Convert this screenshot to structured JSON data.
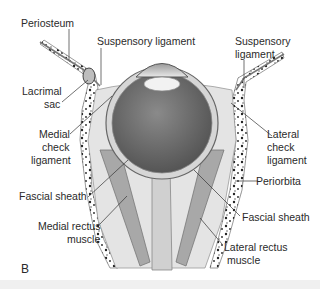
{
  "figure": {
    "panel_letter": "B",
    "labels": {
      "periosteum": "Periosteum",
      "suspensory_ligament_left": "Suspensory ligament",
      "suspensory_ligament_right_line1": "Suspensory",
      "suspensory_ligament_right_line2": "ligament",
      "lacrimal_sac_line1": "Lacrimal",
      "lacrimal_sac_line2": "sac",
      "medial_check_line1": "Medial",
      "medial_check_line2": "check",
      "medial_check_line3": "ligament",
      "lateral_check_line1": "Lateral",
      "lateral_check_line2": "check",
      "lateral_check_line3": "ligament",
      "fascial_sheath_left": "Fascial sheath",
      "periorbita": "Periorbita",
      "fascial_sheath_right": "Fascial sheath",
      "medial_rectus_line1": "Medial rectus",
      "medial_rectus_line2": "muscle",
      "lateral_rectus_line1": "Lateral rectus",
      "lateral_rectus_line2": "muscle"
    },
    "colors": {
      "background": "#ffffff",
      "text": "#2a2a2a",
      "leader_line": "#333333",
      "eyeball_interior": "#6e6e6e",
      "sclera": "#d9d9d9",
      "muscle": "#9a9a9a",
      "fat": "#dcdcdc",
      "bone_speckle": "#222222"
    }
  }
}
